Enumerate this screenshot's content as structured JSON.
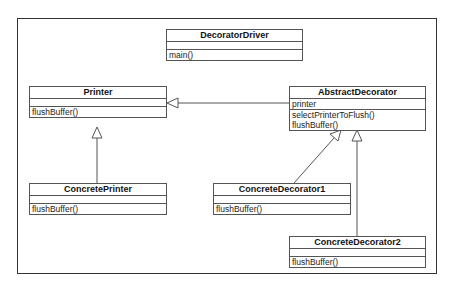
{
  "diagram": {
    "type": "UML class diagram",
    "classes": [
      {
        "id": "decorator-driver",
        "name": "DecoratorDriver",
        "attributes": [],
        "methods": [
          "main()"
        ]
      },
      {
        "id": "printer",
        "name": "Printer",
        "attributes": [],
        "methods": [
          "flushBuffer()"
        ]
      },
      {
        "id": "abstract-decorator",
        "name": "AbstractDecorator",
        "attributes": [
          "printer"
        ],
        "methods": [
          "selectPrinterToFlush()",
          "flushBuffer()"
        ]
      },
      {
        "id": "concrete-printer",
        "name": "ConcretePrinter",
        "attributes": [],
        "methods": [
          "flushBuffer()"
        ]
      },
      {
        "id": "concrete-decorator1",
        "name": "ConcreteDecorator1",
        "attributes": [],
        "methods": [
          "flushBuffer()"
        ]
      },
      {
        "id": "concrete-decorator2",
        "name": "ConcreteDecorator2",
        "attributes": [],
        "methods": [
          "flushBuffer()"
        ]
      }
    ],
    "relationships": [
      {
        "from": "AbstractDecorator",
        "to": "Printer",
        "type": "generalization"
      },
      {
        "from": "ConcretePrinter",
        "to": "Printer",
        "type": "generalization"
      },
      {
        "from": "ConcreteDecorator1",
        "to": "AbstractDecorator",
        "type": "generalization"
      },
      {
        "from": "ConcreteDecorator2",
        "to": "AbstractDecorator",
        "type": "generalization"
      }
    ]
  },
  "colors": {
    "line": "#555555",
    "frame": "#333333",
    "background": "#ffffff"
  }
}
